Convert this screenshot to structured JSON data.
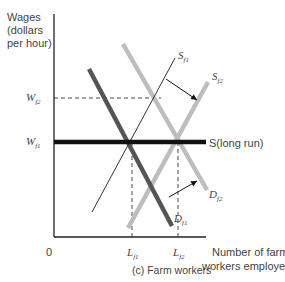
{
  "chart_data": {
    "type": "line",
    "title": "(c) Farm workers",
    "xlabel": "Number of farm workers employed",
    "ylabel": "Wages (dollars per hour)",
    "ylabel_lines": [
      "Wages",
      "(dollars",
      "per hour)"
    ],
    "xlabel_lines": [
      "Number of farm",
      "workers employed"
    ],
    "origin_label": "0",
    "x_ticks": [
      {
        "label": "L",
        "sub": "f1",
        "x": 132
      },
      {
        "label": "L",
        "sub": "f2",
        "x": 178
      }
    ],
    "y_ticks": [
      {
        "label": "W",
        "sub": "f2",
        "y": 98
      },
      {
        "label": "W",
        "sub": "f1",
        "y": 142
      }
    ],
    "series": [
      {
        "name": "S_f1",
        "label": "S",
        "sub": "f1",
        "style": "thin-black",
        "points": [
          [
            92,
            212
          ],
          [
            175,
            58
          ]
        ]
      },
      {
        "name": "S_f2",
        "label": "S",
        "sub": "f2",
        "style": "thick-light-gray",
        "points": [
          [
            128,
            228
          ],
          [
            208,
            82
          ]
        ]
      },
      {
        "name": "D_f1",
        "label": "D",
        "sub": "f1",
        "style": "thick-dark-gray",
        "points": [
          [
            89,
            69
          ],
          [
            172,
            226
          ]
        ]
      },
      {
        "name": "D_f2",
        "label": "D",
        "sub": "f2",
        "style": "thick-light-gray",
        "points": [
          [
            123,
            44
          ],
          [
            207,
            190
          ]
        ]
      },
      {
        "name": "S(long run)",
        "label": "S(long run)",
        "style": "thick-black",
        "points": [
          [
            54,
            142
          ],
          [
            206,
            142
          ]
        ]
      }
    ],
    "annotations": [
      {
        "type": "arrow",
        "from": [
          166,
          79
        ],
        "to": [
          197,
          100
        ],
        "meaning": "supply shifts from S_f1 to S_f2"
      },
      {
        "type": "arrow",
        "from": [
          169,
          197
        ],
        "to": [
          197,
          181
        ],
        "meaning": "demand shifts from D_f1 to D_f2"
      },
      {
        "type": "dashed",
        "from": [
          54,
          98
        ],
        "to": [
          161,
          98
        ],
        "meaning": "W_f2 level"
      },
      {
        "type": "dashed",
        "from": [
          132,
          142
        ],
        "to": [
          132,
          237
        ],
        "meaning": "L_f1"
      },
      {
        "type": "dashed",
        "from": [
          178,
          142
        ],
        "to": [
          178,
          237
        ],
        "meaning": "L_f2"
      }
    ],
    "grid": false,
    "legend": "none",
    "colors": {
      "axis": "#222222",
      "long_run": "#111111",
      "d_f1": "#555555",
      "light": "#bdbdbd",
      "s_f1": "#333333",
      "text": "#444444"
    }
  }
}
